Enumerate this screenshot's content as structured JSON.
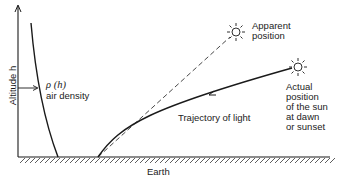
{
  "diagram": {
    "y_axis_label": "Altitude h",
    "density_label_symbol": "ρ (h)",
    "density_label_text": "air density",
    "apparent_label": [
      "Apparent",
      "position"
    ],
    "actual_label": [
      "Actual",
      "position",
      "of the sun",
      "at dawn",
      "or sunset"
    ],
    "trajectory_label": "Trajectory of light",
    "ground_label": "Earth",
    "icons": [
      "sun-icon-apparent",
      "sun-icon-actual"
    ],
    "colors": {
      "line": "#1a1a1a",
      "background": "#ffffff"
    }
  }
}
